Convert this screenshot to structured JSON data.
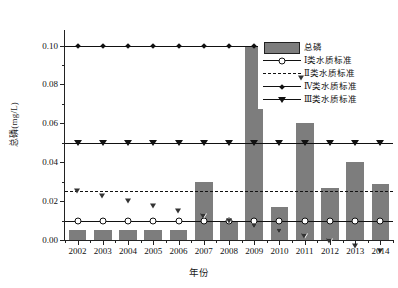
{
  "chart_data": {
    "type": "bar",
    "title": "",
    "xlabel": "年份",
    "ylabel": "总磷(mg/L)",
    "categories": [
      "2002",
      "2003",
      "2004",
      "2005",
      "2006",
      "2007",
      "2008",
      "2009",
      "2010",
      "2011",
      "2012",
      "2013",
      "2014"
    ],
    "ylim": [
      0,
      0.108
    ],
    "yticks": [
      0.0,
      0.02,
      0.04,
      0.06,
      0.08,
      0.1
    ],
    "ytick_labels": [
      "0.00",
      "0.02",
      "0.04",
      "0.06",
      "0.08",
      "0.10"
    ],
    "grid": false,
    "legend_position": "upper right",
    "series": [
      {
        "name": "总磷",
        "kind": "bar",
        "color": "#7d7d7d",
        "values": [
          0.005,
          0.005,
          0.005,
          0.005,
          0.005,
          0.03,
          0.01,
          0.1,
          0.017,
          0.06,
          0.027,
          0.04,
          0.029
        ]
      },
      {
        "name": "Ⅰ类水质标准",
        "kind": "line",
        "marker": "open-circle",
        "linestyle": "solid",
        "level": 0.01,
        "values": [
          0.01,
          0.01,
          0.01,
          0.01,
          0.01,
          0.01,
          0.01,
          0.01,
          0.01,
          0.01,
          0.01,
          0.01,
          0.01
        ]
      },
      {
        "name": "Ⅱ类水质标准",
        "kind": "line",
        "marker": "open-triangle-down",
        "linestyle": "dashed",
        "level": 0.025,
        "values": [
          0.025,
          0.025,
          0.025,
          0.025,
          0.025,
          0.025,
          0.025,
          0.025,
          0.025,
          0.025,
          0.025,
          0.025,
          0.025
        ]
      },
      {
        "name": "Ⅳ类水质标准",
        "kind": "line",
        "marker": "filled-diamond",
        "linestyle": "solid",
        "level": 0.1,
        "values": [
          0.1,
          0.1,
          0.1,
          0.1,
          0.1,
          0.1,
          0.1,
          0.1,
          0.1,
          0.1,
          0.1,
          0.1,
          0.1
        ]
      },
      {
        "name": "Ⅲ类水质标准",
        "kind": "line",
        "marker": "filled-triangle-down",
        "linestyle": "solid",
        "level": 0.05,
        "values": [
          0.05,
          0.05,
          0.05,
          0.05,
          0.05,
          0.05,
          0.05,
          0.05,
          0.05,
          0.05,
          0.05,
          0.05,
          0.05
        ]
      }
    ],
    "legend_entries": [
      "总磷",
      "Ⅰ类水质标准",
      "Ⅱ类水质标准",
      "Ⅳ类水质标准",
      "Ⅲ类水质标准"
    ]
  }
}
